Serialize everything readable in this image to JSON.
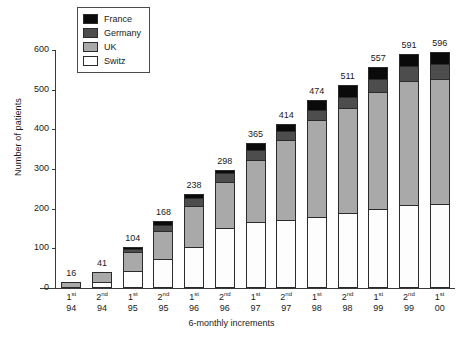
{
  "chart_data": {
    "type": "bar",
    "subtype": "stacked-vertical",
    "title": "",
    "xlabel": "6-monthly increments",
    "ylabel": "Number of patients",
    "ylim": [
      0,
      600
    ],
    "yticks": [
      0,
      100,
      200,
      300,
      400,
      500,
      600
    ],
    "grid": false,
    "legend_position": "top-left-inside",
    "categories": [
      "1st 94",
      "2nd 94",
      "1st 95",
      "2nd 95",
      "1st 96",
      "2nd 96",
      "1st 97",
      "2nd 97",
      "1st 98",
      "2nd 98",
      "1st 99",
      "2nd 99",
      "1st 00"
    ],
    "category_parts": [
      {
        "ordinal": "1",
        "suffix": "st",
        "year": "94"
      },
      {
        "ordinal": "2",
        "suffix": "nd",
        "year": "94"
      },
      {
        "ordinal": "1",
        "suffix": "st",
        "year": "95"
      },
      {
        "ordinal": "2",
        "suffix": "nd",
        "year": "95"
      },
      {
        "ordinal": "1",
        "suffix": "st",
        "year": "96"
      },
      {
        "ordinal": "2",
        "suffix": "nd",
        "year": "96"
      },
      {
        "ordinal": "1",
        "suffix": "st",
        "year": "97"
      },
      {
        "ordinal": "2",
        "suffix": "nd",
        "year": "97"
      },
      {
        "ordinal": "1",
        "suffix": "st",
        "year": "98"
      },
      {
        "ordinal": "2",
        "suffix": "nd",
        "year": "98"
      },
      {
        "ordinal": "1",
        "suffix": "st",
        "year": "99"
      },
      {
        "ordinal": "2",
        "suffix": "nd",
        "year": "99"
      },
      {
        "ordinal": "1",
        "suffix": "st",
        "year": "00"
      }
    ],
    "totals": [
      16,
      41,
      104,
      168,
      238,
      298,
      365,
      414,
      474,
      511,
      557,
      591,
      596
    ],
    "total_labels": [
      "16",
      "41",
      "104",
      "168",
      "238",
      "298",
      "365",
      "414",
      "474",
      "511",
      "557",
      "591",
      "596"
    ],
    "series": [
      {
        "name": "Switz",
        "color": "#ffffff",
        "values": [
          0,
          14,
          42,
          74,
          102,
          152,
          165,
          172,
          178,
          188,
          198,
          208,
          210
        ]
      },
      {
        "name": "UK",
        "color": "#a9a9a9",
        "values": [
          16,
          27,
          52,
          72,
          106,
          118,
          160,
          202,
          248,
          267,
          298,
          315,
          318
        ]
      },
      {
        "name": "Germany",
        "color": "#4d4d4d",
        "values": [
          0,
          0,
          7,
          15,
          21,
          22,
          25,
          23,
          26,
          29,
          32,
          38,
          38
        ]
      },
      {
        "name": "France",
        "color": "#0a0a0a",
        "values": [
          0,
          0,
          3,
          7,
          9,
          6,
          15,
          17,
          22,
          27,
          29,
          30,
          30
        ]
      }
    ],
    "legend": [
      {
        "label": "France",
        "color": "#0a0a0a"
      },
      {
        "label": "Germany",
        "color": "#4d4d4d"
      },
      {
        "label": "UK",
        "color": "#a9a9a9"
      },
      {
        "label": "Switz",
        "color": "#ffffff"
      }
    ]
  }
}
